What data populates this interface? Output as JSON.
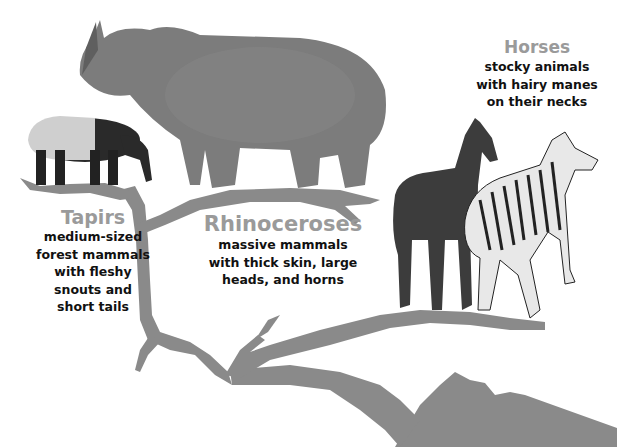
{
  "diagram": {
    "type": "evolutionary-tree",
    "branch_color": "#8a8a8a",
    "title_color": "#9a9a9a",
    "text_color": "#111111"
  },
  "groups": [
    {
      "id": "tapirs",
      "title": "Tapirs",
      "description_lines": [
        "medium-sized",
        "forest mammals",
        "with fleshy",
        "snouts and",
        "short tails"
      ],
      "animal": "tapir"
    },
    {
      "id": "rhinos",
      "title": "Rhinoceroses",
      "description_lines": [
        "massive mammals",
        "with thick skin, large",
        "heads, and horns"
      ],
      "animal": "rhinoceros"
    },
    {
      "id": "horses",
      "title": "Horses",
      "description_lines": [
        "stocky animals",
        "with hairy manes",
        "on their necks"
      ],
      "animals": [
        "horse",
        "zebra"
      ]
    }
  ]
}
